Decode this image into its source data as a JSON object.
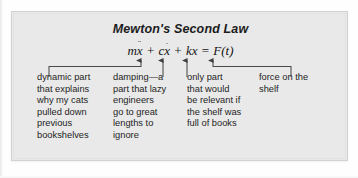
{
  "figure": {
    "title": "Mewton's Second Law",
    "equation": {
      "full_text": "mẍ + cẋ + kx = F(t)",
      "terms": [
        {
          "name": "inertia-term",
          "text": "m",
          "variable": "x",
          "accent": "double-dot"
        },
        {
          "name": "damping-term",
          "text": "c",
          "variable": "x",
          "accent": "single-dot"
        },
        {
          "name": "stiffness-term",
          "text": "k",
          "variable": "x",
          "accent": "none"
        },
        {
          "name": "forcing-term",
          "text": "F(t)",
          "variable": "",
          "accent": "none"
        }
      ],
      "plus_operator": "+",
      "equals_operator": "="
    },
    "annotations": [
      {
        "target_term": "inertia-term",
        "text": "dynamic part\nthat explains\nwhy my cats\npulled down\nprevious\nbookshelves"
      },
      {
        "target_term": "damping-term",
        "text": "damping—a\npart that lazy\nengineers\ngo to great\nlengths to\nignore"
      },
      {
        "target_term": "stiffness-term",
        "text": "only part\nthat would\nbe relevant if\nthe shelf was\nfull of books"
      },
      {
        "target_term": "forcing-term",
        "text": "force on the\nshelf"
      }
    ],
    "colors": {
      "panel_background": "#e9e9e9",
      "panel_border": "#d2d2d2",
      "page_background": "#fefefe",
      "text": "#1c1c1c",
      "leader_line": "#4a4a4a"
    }
  }
}
